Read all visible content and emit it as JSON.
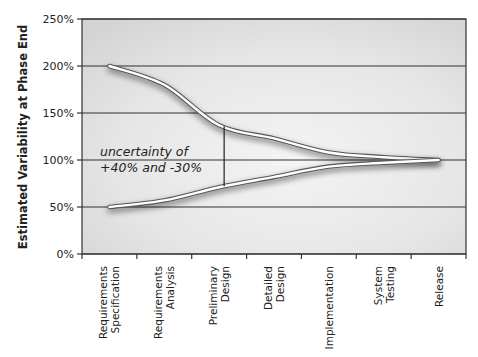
{
  "chart_data": {
    "type": "line",
    "title": "",
    "xlabel": "",
    "ylabel": "Estimated Variability at Phase End",
    "categories": [
      "Requirements Specification",
      "Requirements Analysis",
      "Preliminary Design",
      "Detailed Design",
      "Implementation",
      "System Testing",
      "Release"
    ],
    "category_lines": [
      [
        "Requirements",
        "Specification"
      ],
      [
        "Requirements",
        "Analysis"
      ],
      [
        "Preliminary",
        "Design"
      ],
      [
        "Detailed",
        "Design"
      ],
      [
        "Implementation"
      ],
      [
        "System",
        "Testing"
      ],
      [
        "Release"
      ]
    ],
    "series": [
      {
        "name": "Upper bound",
        "values": [
          200,
          180,
          137,
          123,
          108,
          103,
          100
        ]
      },
      {
        "name": "Lower bound",
        "values": [
          50,
          57,
          71,
          82,
          93,
          97,
          100
        ]
      }
    ],
    "yticks": [
      "0%",
      "50%",
      "100%",
      "150%",
      "200%",
      "250%"
    ],
    "ylim": [
      0,
      250
    ],
    "grid": true,
    "legend": "none",
    "annotation": {
      "lines": [
        "uncertainty of",
        "+40% and -30%"
      ],
      "at_category": "Preliminary Design"
    },
    "colors": {
      "plot_background": "#d9d9d9",
      "line": "#ffffff",
      "grid": "#333333"
    }
  }
}
